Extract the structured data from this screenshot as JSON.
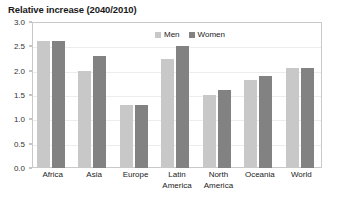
{
  "chart_data": {
    "type": "bar",
    "title": "Relative increase (2040/2010)",
    "xlabel": "",
    "ylabel": "",
    "ylim": [
      0.0,
      3.0
    ],
    "ytick_labels": [
      "3.0",
      "2.5",
      "2.0",
      "1.5",
      "1.0",
      "0.5",
      "0.0"
    ],
    "ytick_values": [
      3.0,
      2.5,
      2.0,
      1.5,
      1.0,
      0.5,
      0.0
    ],
    "grid": true,
    "legend_position": "top-center-inside",
    "categories": [
      "Africa",
      "Asia",
      "Europe",
      "Latin America",
      "North America",
      "Oceania",
      "World"
    ],
    "category_lines": [
      [
        "Africa",
        ""
      ],
      [
        "Asia",
        ""
      ],
      [
        "Europe",
        ""
      ],
      [
        "Latin",
        "America"
      ],
      [
        "North",
        "America"
      ],
      [
        "Oceania",
        ""
      ],
      [
        "World",
        ""
      ]
    ],
    "series": [
      {
        "name": "Men",
        "color": "#c8c8c8",
        "values": [
          2.6,
          2.0,
          1.3,
          2.25,
          1.5,
          1.8,
          2.05
        ]
      },
      {
        "name": "Women",
        "color": "#828282",
        "values": [
          2.6,
          2.3,
          1.3,
          2.5,
          1.6,
          1.9,
          2.05
        ]
      }
    ]
  },
  "colors": {
    "men": "#c8c8c8",
    "women": "#828282",
    "frame": "#c9c9c9",
    "gridline": "#ededed",
    "text": "#1a1a1a",
    "background": "#ffffff"
  }
}
